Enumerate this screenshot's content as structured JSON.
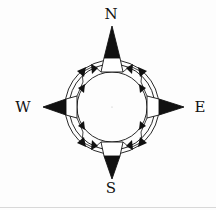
{
  "diagram": {
    "type": "compass-rose",
    "labels": {
      "north": "N",
      "south": "S",
      "east": "E",
      "west": "W"
    },
    "colors": {
      "ink": "#111111",
      "background": "#fdfdfd",
      "rule": "#d8d8d8"
    }
  }
}
